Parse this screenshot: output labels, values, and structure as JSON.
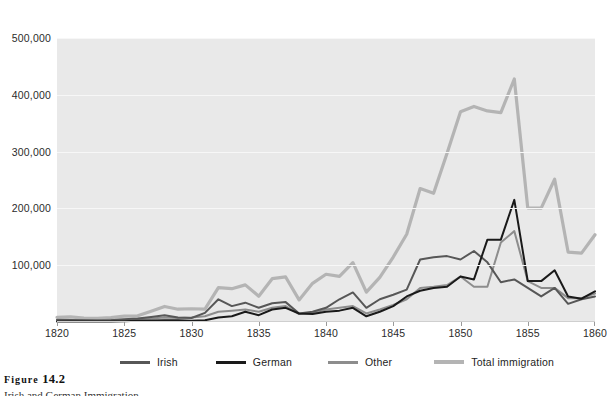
{
  "caption": {
    "figure_word": "Figure",
    "figure_number": "14.2",
    "subtitle": "Irish and German Immigration"
  },
  "legend": {
    "position": "bottom",
    "items": [
      {
        "label": "Irish",
        "color": "#575757"
      },
      {
        "label": "German",
        "color": "#1a1a1a"
      },
      {
        "label": "Other",
        "color": "#8d8d8d"
      },
      {
        "label": "Total immigration",
        "color": "#b4b4b4"
      }
    ]
  },
  "axes": {
    "y_ticks": [
      "500,000",
      "400,000",
      "300,000",
      "200,000",
      "100,000"
    ],
    "x_ticks": [
      "1820",
      "1825",
      "1830",
      "1835",
      "1840",
      "1845",
      "1850",
      "1855",
      "1860"
    ]
  },
  "colors": {
    "plot_background": "#e9e9e9",
    "gridline": "#f7f7f7",
    "page_background": "#ffffff",
    "text": "#2b2b2b"
  },
  "chart_data": {
    "type": "line",
    "title": "Irish and German Immigration",
    "xlabel": "",
    "ylabel": "",
    "xlim": [
      1820,
      1860
    ],
    "ylim": [
      0,
      500000
    ],
    "grid": true,
    "legend_position": "bottom",
    "x": [
      1820,
      1821,
      1822,
      1823,
      1824,
      1825,
      1826,
      1827,
      1828,
      1829,
      1830,
      1831,
      1832,
      1833,
      1834,
      1835,
      1836,
      1837,
      1838,
      1839,
      1840,
      1841,
      1842,
      1843,
      1844,
      1845,
      1846,
      1847,
      1848,
      1849,
      1850,
      1851,
      1852,
      1853,
      1854,
      1855,
      1856,
      1857,
      1858,
      1859,
      1860
    ],
    "series": [
      {
        "name": "Irish",
        "color": "#575757",
        "values": [
          4000,
          3500,
          3000,
          2500,
          3000,
          5000,
          6000,
          9000,
          12000,
          8000,
          7000,
          16000,
          40000,
          28000,
          34000,
          25000,
          33000,
          35000,
          15000,
          18000,
          25000,
          40000,
          52000,
          25000,
          40000,
          48000,
          57000,
          110000,
          114000,
          116000,
          110000,
          125000,
          105000,
          70000,
          75000,
          60000,
          45000,
          60000,
          32000,
          40000,
          45000
        ]
      },
      {
        "name": "German",
        "color": "#1a1a1a",
        "values": [
          1000,
          1000,
          1000,
          1000,
          1000,
          1500,
          2000,
          2500,
          3000,
          3000,
          2000,
          3000,
          8000,
          10000,
          18000,
          12000,
          22000,
          25000,
          15000,
          14000,
          18000,
          20000,
          25000,
          10000,
          18000,
          28000,
          45000,
          55000,
          60000,
          62000,
          80000,
          75000,
          145000,
          145000,
          215000,
          72000,
          72000,
          91000,
          45000,
          41000,
          54000
        ]
      },
      {
        "name": "Other",
        "color": "#8d8d8d",
        "values": [
          3000,
          3000,
          3000,
          3000,
          4000,
          4000,
          5000,
          6000,
          8000,
          7000,
          8000,
          10000,
          18000,
          20000,
          22000,
          18000,
          25000,
          28000,
          14000,
          16000,
          22000,
          25000,
          28000,
          15000,
          22000,
          30000,
          40000,
          60000,
          62000,
          65000,
          80000,
          62000,
          62000,
          140000,
          160000,
          72000,
          60000,
          60000,
          42000,
          42000,
          50000
        ]
      },
      {
        "name": "Total immigration",
        "color": "#b4b4b4",
        "values": [
          8385,
          9127,
          6911,
          6354,
          7912,
          10199,
          10837,
          18875,
          27382,
          22520,
          23322,
          22633,
          60482,
          58640,
          65365,
          45374,
          76242,
          79340,
          38914,
          68069,
          84066,
          80289,
          104565,
          52496,
          78615,
          114371,
          154416,
          234968,
          226527,
          297024,
          369980,
          379466,
          371603,
          368645,
          427833,
          200877,
          200436,
          251306,
          123126,
          121282,
          153640
        ]
      }
    ]
  }
}
